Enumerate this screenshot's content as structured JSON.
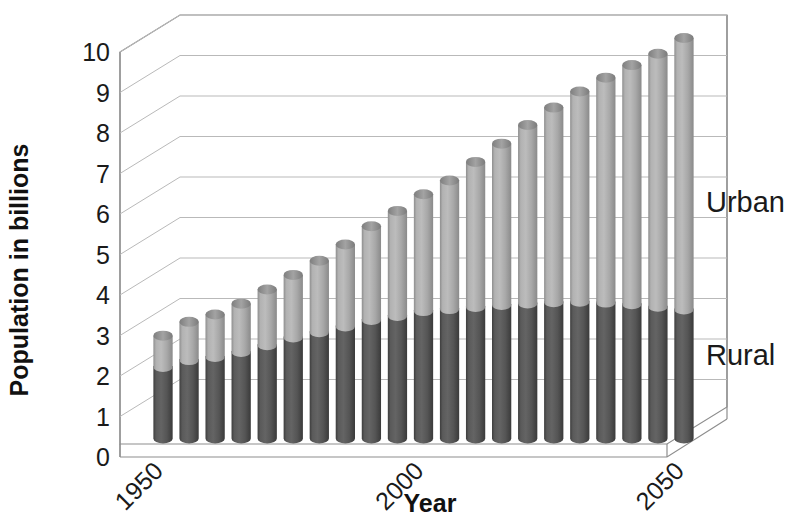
{
  "chart_data": {
    "type": "bar",
    "subtype": "stacked-3d-cylinder",
    "title": "",
    "xlabel": "Year",
    "ylabel": "Population in billions",
    "ylim": [
      0,
      10
    ],
    "ytick_labels": [
      "0",
      "1",
      "2",
      "3",
      "4",
      "5",
      "6",
      "7",
      "8",
      "9",
      "10"
    ],
    "ytick_values": [
      0,
      1,
      2,
      3,
      4,
      5,
      6,
      7,
      8,
      9,
      10
    ],
    "grid": true,
    "legend_position": "right-inline",
    "categories": [
      1950,
      1955,
      1960,
      1965,
      1970,
      1975,
      1980,
      1985,
      1990,
      1995,
      2000,
      2005,
      2010,
      2015,
      2020,
      2025,
      2030,
      2035,
      2040,
      2045,
      2050
    ],
    "xtick_labels": [
      "1950",
      "2000",
      "2050"
    ],
    "xtick_positions": [
      1950,
      2000,
      2050
    ],
    "series": [
      {
        "name": "Rural",
        "color": "#4d4d4d",
        "values": [
          1.79,
          1.96,
          2.04,
          2.16,
          2.33,
          2.52,
          2.65,
          2.79,
          2.95,
          3.05,
          3.17,
          3.22,
          3.27,
          3.32,
          3.36,
          3.39,
          3.4,
          3.38,
          3.34,
          3.28,
          3.21
        ]
      },
      {
        "name": "Urban",
        "color": "#a9a9a9",
        "values": [
          0.75,
          0.92,
          1.02,
          1.17,
          1.35,
          1.52,
          1.74,
          2.0,
          2.29,
          2.57,
          2.86,
          3.15,
          3.56,
          3.96,
          4.38,
          4.78,
          5.17,
          5.53,
          5.88,
          6.22,
          6.68
        ]
      }
    ],
    "totals": [
      2.54,
      2.88,
      3.06,
      3.33,
      3.68,
      4.04,
      4.39,
      4.79,
      5.24,
      5.62,
      6.03,
      6.37,
      6.83,
      7.28,
      7.74,
      8.17,
      8.57,
      8.91,
      9.22,
      9.5,
      9.89
    ]
  },
  "labels": {
    "y_axis_title": "Population in billions",
    "x_axis_title": "Year",
    "urban": "Urban",
    "rural": "Rural"
  }
}
